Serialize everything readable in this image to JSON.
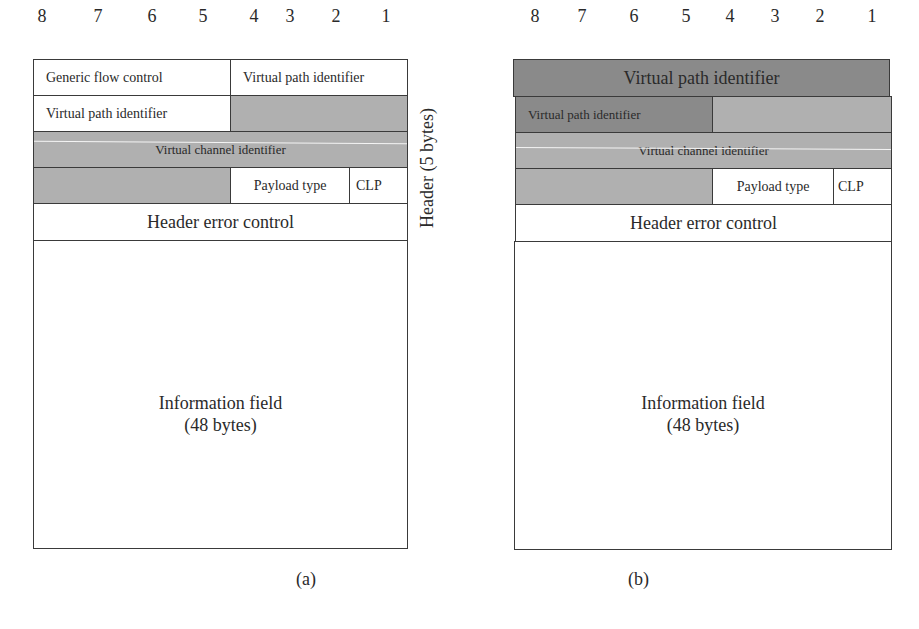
{
  "bit_numbers": [
    "8",
    "7",
    "6",
    "5",
    "4",
    "3",
    "2",
    "1"
  ],
  "colors": {
    "light_shade": "#b0b0b0",
    "dark_shade": "#8a8a8a",
    "border": "#3a3a3a"
  },
  "diagram_a": {
    "caption": "(a)",
    "side_label": "Header (5 bytes)",
    "row1": {
      "left": "Generic flow control",
      "right": "Virtual path identifier"
    },
    "row2": {
      "left": "Virtual path identifier",
      "right": ""
    },
    "row3": {
      "full": "Virtual channel identifier"
    },
    "row4": {
      "left": "",
      "payload": "Payload type",
      "clp": "CLP"
    },
    "row5": {
      "full": "Header error control"
    },
    "info": {
      "line1": "Information field",
      "line2": "(48 bytes)"
    }
  },
  "diagram_b": {
    "caption": "(b)",
    "row1": {
      "full": "Virtual path identifier"
    },
    "row2": {
      "left": "Virtual path identifier",
      "right": ""
    },
    "row3": {
      "full": "Virtual channel identifier"
    },
    "row4": {
      "left": "",
      "payload": "Payload type",
      "clp": "CLP"
    },
    "row5": {
      "full": "Header error control"
    },
    "info": {
      "line1": "Information field",
      "line2": "(48 bytes)"
    }
  }
}
